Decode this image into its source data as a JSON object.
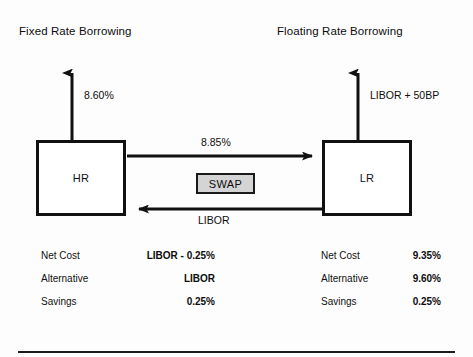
{
  "diagram": {
    "title_left": "Fixed Rate Borrowing",
    "title_right": "Floating Rate Borrowing",
    "left_party": "HR",
    "right_party": "LR",
    "swap_label": "SWAP",
    "left_outflow_label": "8.60%",
    "right_outflow_label": "LIBOR + 50BP",
    "top_flow_label": "8.85%",
    "bottom_flow_label": "LIBOR",
    "colors": {
      "ink": "#111111",
      "swap_fill": "#d4d4d4",
      "background": "#ffffff"
    }
  },
  "left_table": {
    "rows": [
      {
        "key": "Net Cost",
        "value": "LIBOR - 0.25%"
      },
      {
        "key": "Alternative",
        "value": "LIBOR"
      },
      {
        "key": "Savings",
        "value": "0.25%"
      }
    ]
  },
  "right_table": {
    "rows": [
      {
        "key": "Net Cost",
        "value": "9.35%"
      },
      {
        "key": "Alternative",
        "value": "9.60%"
      },
      {
        "key": "Savings",
        "value": "0.25%"
      }
    ]
  }
}
